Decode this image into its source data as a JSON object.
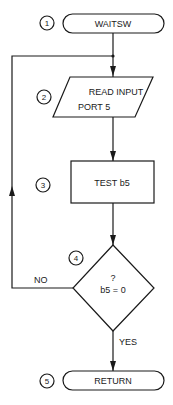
{
  "diagram": {
    "type": "flowchart",
    "nodes": [
      {
        "id": 1,
        "shape": "terminal",
        "label": "WAITSW"
      },
      {
        "id": 2,
        "shape": "input-output",
        "label_line1": "READ INPUT",
        "label_line2": "PORT 5"
      },
      {
        "id": 3,
        "shape": "process",
        "label": "TEST b5"
      },
      {
        "id": 4,
        "shape": "decision",
        "label_line1": "?",
        "label_line2": "b5 = 0"
      },
      {
        "id": 5,
        "shape": "terminal",
        "label": "RETURN"
      }
    ],
    "step_numbers": [
      "1",
      "2",
      "3",
      "4",
      "5"
    ],
    "edges": [
      {
        "from": 1,
        "to": 2,
        "label": ""
      },
      {
        "from": 2,
        "to": 3,
        "label": ""
      },
      {
        "from": 3,
        "to": 4,
        "label": ""
      },
      {
        "from": 4,
        "to": 2,
        "label": "NO"
      },
      {
        "from": 4,
        "to": 5,
        "label": "YES"
      }
    ],
    "edge_labels": {
      "no": "NO",
      "yes": "YES"
    }
  }
}
